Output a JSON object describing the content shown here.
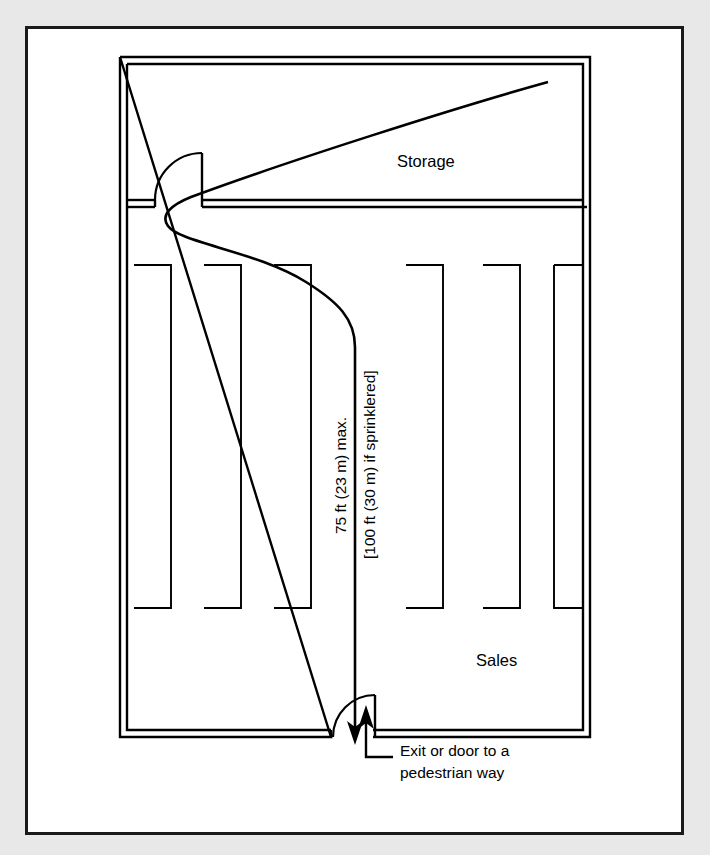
{
  "figure": {
    "type": "floor-plan-diagram",
    "background_color": "#e8e8e8",
    "card_color": "#ffffff",
    "line_color": "#000000"
  },
  "rooms": {
    "storage": {
      "label": "Storage"
    },
    "sales": {
      "label": "Sales"
    }
  },
  "dimensions": {
    "primary": "75 ft (23 m) max.",
    "secondary": "[100 ft (30 m) if sprinklered]"
  },
  "callouts": {
    "exit": {
      "line1": "Exit or door to a",
      "line2": "pedestrian way"
    }
  },
  "icons": {
    "travel_path": "travel-path-arrow",
    "interior_door": "door-swing-icon",
    "exit_door": "exit-door-swing-icon",
    "shelving": "shelving-rack-icon"
  }
}
